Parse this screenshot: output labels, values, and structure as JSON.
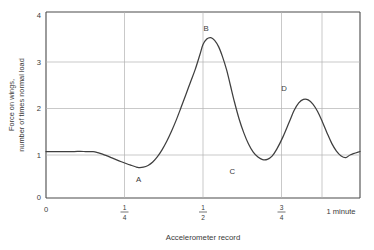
{
  "chart_data": {
    "type": "line",
    "title": "",
    "xlabel": "Accelerometer record",
    "ylabel_line1": "Force on wings,",
    "ylabel_line2": "number of times normal load",
    "xlim": [
      0,
      1
    ],
    "ylim": [
      0,
      4
    ],
    "grid": true,
    "legend": "none",
    "y_ticks": [
      "0",
      "1",
      "2",
      "3",
      "4"
    ],
    "y_tick_values": [
      0,
      1,
      2,
      3,
      4
    ],
    "x_ticks": [
      {
        "label": "0",
        "value": 0,
        "type": "plain"
      },
      {
        "label": "1/4",
        "numerator": "1",
        "denominator": "4",
        "value": 0.25,
        "type": "fraction"
      },
      {
        "label": "1/2",
        "numerator": "1",
        "denominator": "2",
        "value": 0.5,
        "type": "fraction"
      },
      {
        "label": "3/4",
        "numerator": "3",
        "denominator": "4",
        "value": 0.75,
        "type": "fraction"
      },
      {
        "label": "1 minute",
        "value": 1.0,
        "type": "plain"
      }
    ],
    "annotations": [
      {
        "name": "A",
        "x": 0.295,
        "y": 0.65,
        "label_dx": 0,
        "label_dy": 14
      },
      {
        "name": "B",
        "x": 0.5,
        "y": 3.45,
        "label_dx": 3,
        "label_dy": -7
      },
      {
        "name": "C",
        "x": 0.59,
        "y": 0.82,
        "label_dx": 1,
        "label_dy": 14
      },
      {
        "name": "D",
        "x": 0.755,
        "y": 2.12,
        "label_dx": 1,
        "label_dy": -8
      }
    ],
    "x": [
      0.0,
      0.03,
      0.06,
      0.09,
      0.12,
      0.15,
      0.165,
      0.18,
      0.195,
      0.21,
      0.225,
      0.24,
      0.255,
      0.27,
      0.285,
      0.295,
      0.31,
      0.325,
      0.34,
      0.355,
      0.37,
      0.385,
      0.4,
      0.415,
      0.43,
      0.445,
      0.46,
      0.475,
      0.49,
      0.5,
      0.512,
      0.525,
      0.537,
      0.55,
      0.562,
      0.575,
      0.587,
      0.6,
      0.615,
      0.63,
      0.645,
      0.66,
      0.675,
      0.69,
      0.705,
      0.72,
      0.735,
      0.755,
      0.775,
      0.79,
      0.805,
      0.82,
      0.835,
      0.85,
      0.865,
      0.88,
      0.895,
      0.91,
      0.925,
      0.94,
      0.955,
      0.97,
      1.0
    ],
    "y": [
      1.0,
      1.0,
      1.0,
      1.0,
      1.0,
      0.995,
      0.975,
      0.945,
      0.905,
      0.862,
      0.82,
      0.78,
      0.742,
      0.706,
      0.672,
      0.655,
      0.662,
      0.7,
      0.775,
      0.89,
      1.04,
      1.225,
      1.44,
      1.68,
      1.945,
      2.215,
      2.49,
      2.76,
      3.08,
      3.3,
      3.42,
      3.45,
      3.39,
      3.25,
      3.04,
      2.76,
      2.43,
      2.07,
      1.7,
      1.4,
      1.16,
      0.985,
      0.88,
      0.825,
      0.83,
      0.9,
      1.05,
      1.32,
      1.64,
      1.88,
      2.045,
      2.12,
      2.11,
      2.02,
      1.86,
      1.64,
      1.4,
      1.175,
      1.01,
      0.905,
      0.87,
      0.93,
      1.0
    ]
  }
}
